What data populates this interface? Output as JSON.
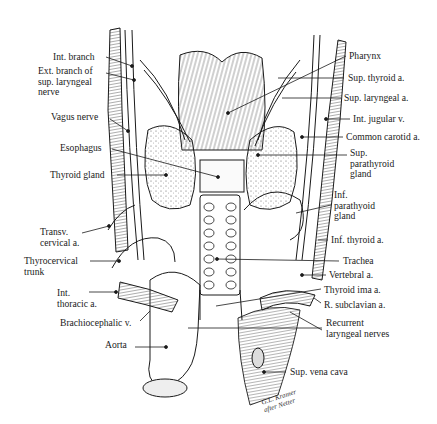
{
  "figure": {
    "signature": "G.L. Kramer\nafter Netter",
    "colors": {
      "ink": "#1a1a1a",
      "background": "#ffffff",
      "shading": "#555555"
    }
  },
  "labels": {
    "left": [
      {
        "id": "int-branch",
        "text": "Int. branch",
        "x": 53,
        "y": 52,
        "pointer": [
          [
            106,
            57
          ],
          [
            132,
            66
          ]
        ]
      },
      {
        "id": "ext-branch",
        "text": "Ext. branch of\nsup. laryngeal\nnerve",
        "x": 38,
        "y": 66,
        "pointer": [
          [
            106,
            73
          ],
          [
            134,
            80
          ]
        ]
      },
      {
        "id": "vagus-nerve",
        "text": "Vagus nerve",
        "x": 51,
        "y": 112,
        "pointer": [
          [
            110,
            119
          ],
          [
            128,
            131
          ]
        ]
      },
      {
        "id": "esophagus",
        "text": "Esophagus",
        "x": 60,
        "y": 143,
        "pointer": [
          [
            112,
            149
          ],
          [
            218,
            177
          ]
        ]
      },
      {
        "id": "thyroid-gland-left",
        "text": "Thyroid gland",
        "x": 50,
        "y": 170,
        "pointer": [
          [
            117,
            175
          ],
          [
            166,
            175
          ]
        ]
      },
      {
        "id": "transv-cervical",
        "text": "Transv.\ncervical a.",
        "x": 40,
        "y": 227,
        "pointer": [
          [
            82,
            233
          ],
          [
            109,
            226
          ]
        ]
      },
      {
        "id": "thyrocervical-trunk",
        "text": "Thyrocervical\ntrunk",
        "x": 24,
        "y": 256,
        "pointer": [
          [
            90,
            261
          ],
          [
            119,
            261
          ]
        ]
      },
      {
        "id": "int-thoracic",
        "text": "Int.\nthoracic a.",
        "x": 57,
        "y": 288,
        "pointer": [
          [
            89,
            292
          ],
          [
            116,
            292
          ]
        ]
      },
      {
        "id": "brachiocephalic-v",
        "text": "Brachiocephalic v.",
        "x": 60,
        "y": 318,
        "pointer": [
          [
            140,
            321
          ],
          [
            150,
            311
          ]
        ]
      },
      {
        "id": "aorta",
        "text": "Aorta",
        "x": 105,
        "y": 340,
        "pointer": [
          [
            135,
            347
          ],
          [
            166,
            347
          ]
        ]
      }
    ],
    "right": [
      {
        "id": "pharynx",
        "text": "Pharynx",
        "x": 349,
        "y": 51,
        "pointer": [
          [
            346,
            56
          ],
          [
            228,
            113
          ]
        ]
      },
      {
        "id": "sup-thyroid-a",
        "text": "Sup. thyroid a.",
        "x": 348,
        "y": 73,
        "pointer": [
          [
            344,
            78
          ],
          [
            278,
            78
          ]
        ]
      },
      {
        "id": "sup-laryngeal-a",
        "text": "Sup. laryngeal a.",
        "x": 344,
        "y": 93,
        "pointer": [
          [
            341,
            98
          ],
          [
            282,
            98
          ]
        ]
      },
      {
        "id": "int-jugular-v",
        "text": "Int. jugular v.",
        "x": 353,
        "y": 114,
        "pointer": [
          [
            350,
            119
          ],
          [
            326,
            119
          ]
        ]
      },
      {
        "id": "common-carotid-a",
        "text": "Common carotid a.",
        "x": 346,
        "y": 132,
        "pointer": [
          [
            343,
            137
          ],
          [
            302,
            137
          ]
        ]
      },
      {
        "id": "sup-parathyroid",
        "text": "Sup.\nparathyroid\ngland",
        "x": 350,
        "y": 148,
        "pointer": [
          [
            347,
            155
          ],
          [
            258,
            155
          ]
        ]
      },
      {
        "id": "inf-parathyoid",
        "text": "Inf.\nparathyoid\ngland",
        "x": 334,
        "y": 190,
        "pointer": [
          [
            331,
            205
          ],
          [
            296,
            213
          ]
        ]
      },
      {
        "id": "inf-thyroid-a",
        "text": "Inf. thyroid a.",
        "x": 331,
        "y": 235,
        "pointer": [
          [
            328,
            240
          ],
          [
            318,
            240
          ]
        ]
      },
      {
        "id": "trachea",
        "text": "Trachea",
        "x": 343,
        "y": 256,
        "pointer": [
          [
            339,
            261
          ],
          [
            217,
            259
          ]
        ]
      },
      {
        "id": "vertebral-a",
        "text": "Vertebral a.",
        "x": 329,
        "y": 270,
        "pointer": [
          [
            326,
            275
          ],
          [
            302,
            275
          ]
        ]
      },
      {
        "id": "thyroid-ima-a",
        "text": "Thyroid ima a.",
        "x": 324,
        "y": 285,
        "pointer": [
          [
            321,
            289
          ],
          [
            216,
            306
          ]
        ]
      },
      {
        "id": "r-subclavian-a",
        "text": "R. subclavian a.",
        "x": 324,
        "y": 300,
        "pointer": [
          [
            321,
            303
          ],
          [
            314,
            298
          ]
        ]
      },
      {
        "id": "recurrent-laryngeal-nerves",
        "text": "Recurrent\nlaryngeal nerves",
        "x": 326,
        "y": 318,
        "pointer": [
          [
            322,
            328
          ],
          [
            188,
            328
          ]
        ]
      },
      {
        "id": "sup-vena-cava",
        "text": "Sup. vena cava",
        "x": 290,
        "y": 367,
        "pointer": [
          [
            286,
            372
          ],
          [
            264,
            372
          ]
        ]
      }
    ]
  }
}
